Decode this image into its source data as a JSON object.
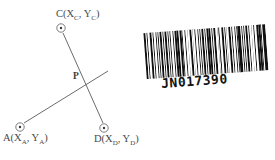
{
  "figure": {
    "background_color": "#ffffff",
    "line_color": "#5a5a5a",
    "points": [
      {
        "id": "C",
        "label": "C(X",
        "sub1": "C",
        "mid": ", Y",
        "sub2": "C",
        "close": ")",
        "cx": 61,
        "cy": 28
      },
      {
        "id": "A",
        "label": "A(X",
        "sub1": "A",
        "mid": ", Y",
        "sub2": "A",
        "close": ")",
        "cx": 20,
        "cy": 127
      },
      {
        "id": "D",
        "label": "D(X",
        "sub1": "D",
        "mid": ", Y",
        "sub2": "D",
        "close": ")",
        "cx": 104,
        "cy": 128
      }
    ],
    "intersection": {
      "id": "P",
      "label": "P",
      "x": 86,
      "y": 82
    },
    "segments": [
      {
        "name": "segment-C-D",
        "x1": 63,
        "y1": 33,
        "x2": 103,
        "y2": 123
      },
      {
        "name": "segment-A-P-extended",
        "x1": 24,
        "y1": 123,
        "x2": 108,
        "y2": 71
      }
    ]
  },
  "barcode": {
    "number": "JN017390",
    "rotation_deg": -4.2,
    "bar_color": "#111111",
    "pattern": [
      3,
      2,
      1,
      2,
      3,
      2,
      1,
      3,
      2,
      1,
      1,
      2,
      3,
      1,
      2,
      1,
      3,
      2,
      1,
      1,
      2,
      3,
      1,
      2,
      2,
      1,
      3,
      1,
      2,
      1,
      1,
      3,
      2,
      2,
      1,
      2,
      3,
      1,
      1,
      2,
      2,
      3,
      1,
      1,
      2,
      1,
      3,
      2,
      1,
      2,
      2,
      1,
      3,
      1,
      1,
      2,
      3,
      2,
      1,
      1,
      2,
      2,
      3,
      1,
      2,
      1,
      1,
      3,
      2,
      1,
      2,
      3,
      1,
      2,
      1,
      1,
      3,
      2,
      2,
      1,
      2,
      1,
      3,
      1,
      2,
      2,
      1,
      3,
      1,
      2,
      3,
      1,
      2,
      1,
      1,
      2,
      3,
      2
    ]
  }
}
